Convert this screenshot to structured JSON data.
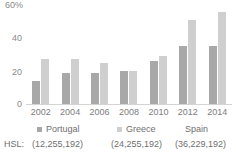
{
  "chart_data": {
    "type": "bar",
    "title": "",
    "xlabel": "",
    "ylabel": "",
    "ylim": [
      0,
      60
    ],
    "grid": false,
    "legend_position": "bottom",
    "categories": [
      "2002",
      "2004",
      "2006",
      "2008",
      "2010",
      "2012",
      "2014"
    ],
    "ytick_labels": [
      "60%",
      "40",
      "20",
      "0"
    ],
    "ytick_values": [
      60,
      40,
      20,
      0
    ],
    "series": [
      {
        "name": "Portugal",
        "color": "#a8a8a8",
        "values": [
          14,
          19,
          19,
          20,
          26,
          35,
          35
        ]
      },
      {
        "name": "Greece",
        "color": "#cfcfcf",
        "values": [
          27,
          27,
          25,
          20,
          29,
          51,
          56
        ]
      },
      {
        "name": "Spain",
        "color": "#ffffff",
        "values": [
          0,
          0,
          0,
          0,
          0,
          0,
          0
        ]
      }
    ]
  },
  "legend": {
    "items": [
      {
        "label": "Portugal",
        "hsl": "(12,255,192)"
      },
      {
        "label": "Greece",
        "hsl": "(24,255,192)"
      },
      {
        "label": "Spain",
        "hsl": "(36,229,192)"
      }
    ]
  },
  "hsl_row": {
    "label": "HSL:"
  }
}
